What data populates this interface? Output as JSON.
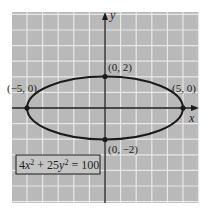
{
  "chart_data": {
    "type": "line",
    "title": "",
    "equation": "4x² + 25y² = 100",
    "xlabel": "x",
    "ylabel": "y",
    "xlim": [
      -6,
      6
    ],
    "ylim": [
      -6,
      6
    ],
    "grid": true,
    "curve": {
      "kind": "ellipse",
      "center": [
        0,
        0
      ],
      "a": 5,
      "b": 2
    },
    "points": [
      {
        "label": "(0, 2)",
        "x": 0,
        "y": 2
      },
      {
        "label": "(0, −2)",
        "x": 0,
        "y": -2
      },
      {
        "label": "(−5, 0)",
        "x": -5,
        "y": 0
      },
      {
        "label": "(5, 0)",
        "x": 5,
        "y": 0
      }
    ]
  },
  "labels": {
    "x_axis": "x",
    "y_axis": "y",
    "top": "(0, 2)",
    "bottom": "(0, −2)",
    "left": "(−5, 0)",
    "right": "(5, 0)"
  },
  "colors": {
    "grid_bg": "#b9b9b9",
    "grid_line": "#e8e8e8",
    "ink": "#1a1a1a"
  }
}
